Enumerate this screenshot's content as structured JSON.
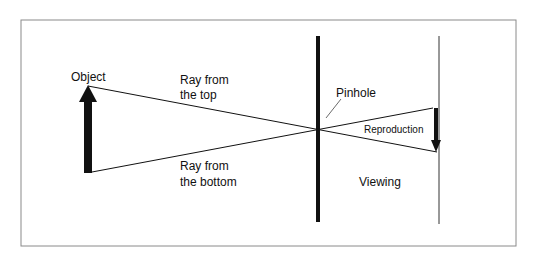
{
  "diagram": {
    "labels": {
      "object": "Object",
      "ray_top_line1": "Ray from",
      "ray_top_line2": "the top",
      "ray_bottom_line1": "Ray from",
      "ray_bottom_line2": "the bottom",
      "pinhole": "Pinhole",
      "reproduction": "Reproduction",
      "viewing": "Viewing"
    },
    "colors": {
      "background": "#ffffff",
      "frame": "#8a8a8a",
      "ink": "#111111"
    }
  }
}
